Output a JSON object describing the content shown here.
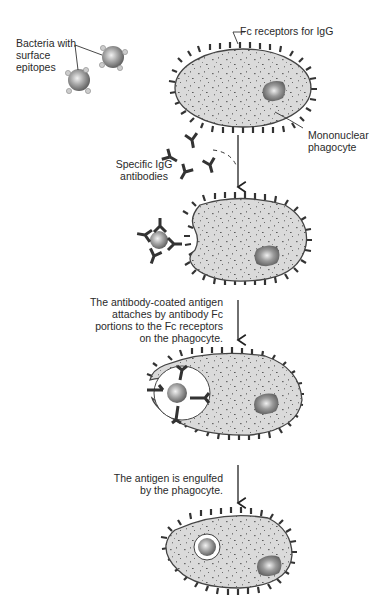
{
  "labels": {
    "bacteria": "Bacteria with\nsurface\nepitopes",
    "fc_receptors": "Fc receptors for IgG",
    "phagocyte": "Mononuclear\nphagocyte",
    "igg": "Specific IgG\nantibodies",
    "step2": "The antibody-coated antigen\nattaches by antibody Fc\nportions to the Fc receptors\non the phagocyte.",
    "step3": "The antigen is engulfed\nby the phagocyte."
  },
  "colors": {
    "cell_fill": "#d9d9d9",
    "cell_outline": "#4a4a4a",
    "receptor": "#333333",
    "antibody": "#333333",
    "nucleus": "#8a8a8a",
    "bacterium": "#9a9a9a",
    "epitope": "#c8c8c8",
    "text": "#2a2a2a"
  },
  "stages": [
    {
      "name": "resting-phagocyte"
    },
    {
      "name": "antibody-coated-bacterium-approaching"
    },
    {
      "name": "bacterium-bound-to-fc-receptors"
    },
    {
      "name": "bacterium-engulfed-in-phagosome"
    }
  ]
}
